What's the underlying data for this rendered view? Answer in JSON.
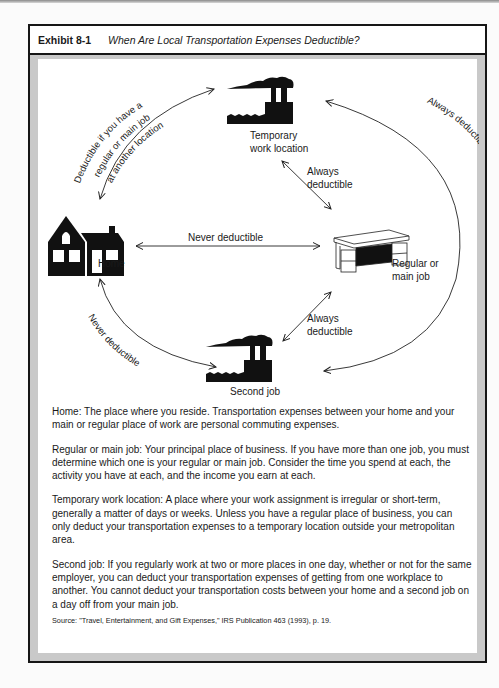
{
  "exhibit": {
    "number": "Exhibit 8-1",
    "title": "When Are Local Transportation Expenses Deductible?"
  },
  "diagram": {
    "nodes": {
      "temporary": {
        "label_line1": "Temporary",
        "label_line2": "work location",
        "icon": "factory-icon"
      },
      "home": {
        "label": "Home",
        "icon": "house-icon"
      },
      "regular": {
        "label_line1": "Regular or",
        "label_line2": "main job",
        "icon": "desk-icon"
      },
      "second": {
        "label": "Second job",
        "icon": "factory-icon"
      }
    },
    "edges": {
      "home_to_temporary": {
        "line1": "Deductible if you have a",
        "line2": "regular or main job",
        "line3": "at another location"
      },
      "temporary_to_regular": {
        "line1": "Always",
        "line2": "deductible"
      },
      "home_to_regular": {
        "label": "Never deductible"
      },
      "regular_to_second": {
        "line1": "Always",
        "line2": "deductible"
      },
      "temporary_to_second": {
        "label": "Always deductible"
      },
      "home_to_second": {
        "label": "Never deductible"
      }
    }
  },
  "definitions": [
    {
      "text": "Home:  The place where you reside.  Transportation expenses between your home and your main or regular place of work are personal commuting expenses."
    },
    {
      "text": "Regular or main job:  Your principal place of business.  If you have more than one job, you must determine which one is your regular or main job.  Consider the time you spend at each, the activity you have at each, and the income you earn at each."
    },
    {
      "text": "Temporary work location:  A place where your work assignment is irregular or short-term, generally a matter of days or weeks.  Unless you have a regular place of business, you can only deduct your transportation expenses to a temporary location outside your metropolitan area."
    },
    {
      "text": "Second job:  If you regularly work at two or more places in one day, whether or not for the same employer, you can deduct your transportation expenses of getting from one workplace to another.  You cannot deduct your transportation costs between your home and a second job on a day off from your main job."
    }
  ],
  "source": "Source:  \"Travel, Entertainment, and Gift Expenses,\" IRS Publication 463 (1993), p. 19."
}
